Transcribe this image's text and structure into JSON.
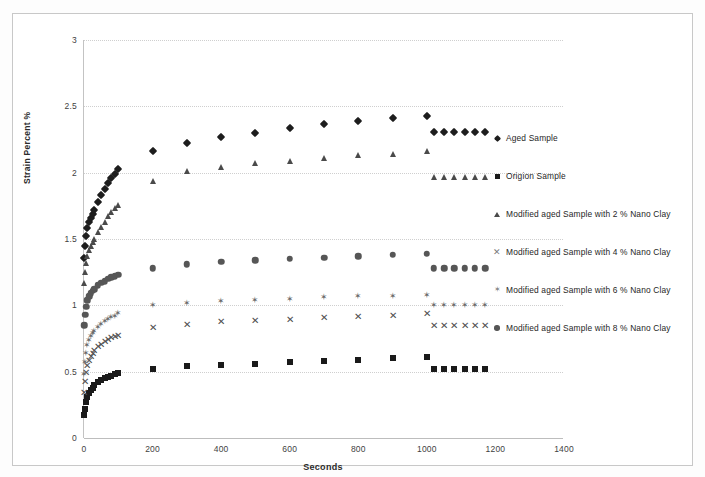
{
  "chart_data": {
    "type": "scatter",
    "title": "",
    "xlabel": "Seconds",
    "ylabel": "Strain Percent %",
    "xlim": [
      0,
      1400
    ],
    "ylim": [
      0,
      3
    ],
    "xticks": [
      0,
      200,
      400,
      600,
      800,
      1000,
      1200,
      1400
    ],
    "yticks": [
      0,
      0.5,
      1,
      1.5,
      2,
      2.5,
      3
    ],
    "grid": true,
    "legend_position": "right",
    "series": [
      {
        "name": "Aged Sample",
        "marker": "diamond",
        "color": "#1d1d1d",
        "x": [
          1,
          3,
          6,
          10,
          15,
          20,
          25,
          30,
          40,
          50,
          60,
          70,
          80,
          90,
          100,
          200,
          300,
          400,
          500,
          600,
          700,
          800,
          900,
          1000,
          1020,
          1050,
          1080,
          1110,
          1140,
          1170
        ],
        "y": [
          1.36,
          1.45,
          1.52,
          1.58,
          1.63,
          1.66,
          1.69,
          1.72,
          1.78,
          1.83,
          1.88,
          1.92,
          1.96,
          1.99,
          2.03,
          2.16,
          2.22,
          2.27,
          2.3,
          2.34,
          2.37,
          2.39,
          2.41,
          2.43,
          2.31,
          2.31,
          2.31,
          2.31,
          2.31,
          2.31
        ]
      },
      {
        "name": "Origion Sample",
        "marker": "square",
        "color": "#1a1a1a",
        "x": [
          1,
          3,
          6,
          10,
          15,
          20,
          25,
          30,
          40,
          50,
          60,
          70,
          80,
          90,
          100,
          200,
          300,
          400,
          500,
          600,
          700,
          800,
          900,
          1000,
          1020,
          1050,
          1080,
          1110,
          1140,
          1170
        ],
        "y": [
          0.17,
          0.22,
          0.27,
          0.31,
          0.34,
          0.36,
          0.38,
          0.4,
          0.42,
          0.44,
          0.45,
          0.46,
          0.47,
          0.48,
          0.49,
          0.52,
          0.54,
          0.55,
          0.56,
          0.57,
          0.58,
          0.59,
          0.6,
          0.61,
          0.52,
          0.52,
          0.52,
          0.52,
          0.52,
          0.52
        ]
      },
      {
        "name": "Modified aged Sample with 2 % Nano Clay",
        "marker": "triangle",
        "color": "#4a4a4a",
        "x": [
          1,
          3,
          6,
          10,
          15,
          20,
          25,
          30,
          40,
          50,
          60,
          70,
          80,
          90,
          100,
          200,
          300,
          400,
          500,
          600,
          700,
          800,
          900,
          1000,
          1020,
          1050,
          1080,
          1110,
          1140,
          1170
        ],
        "y": [
          1.17,
          1.25,
          1.32,
          1.37,
          1.42,
          1.45,
          1.48,
          1.5,
          1.55,
          1.59,
          1.63,
          1.67,
          1.7,
          1.73,
          1.76,
          1.94,
          2.01,
          2.04,
          2.07,
          2.09,
          2.11,
          2.13,
          2.14,
          2.16,
          1.97,
          1.97,
          1.97,
          1.97,
          1.97,
          1.97
        ]
      },
      {
        "name": "Modified aged Sample with 4 % Nano Clay",
        "marker": "cross",
        "color": "#4e4e4e",
        "x": [
          1,
          3,
          6,
          10,
          15,
          20,
          25,
          30,
          40,
          50,
          60,
          70,
          80,
          90,
          100,
          200,
          300,
          400,
          500,
          600,
          700,
          800,
          900,
          1000,
          1020,
          1050,
          1080,
          1110,
          1140,
          1170
        ],
        "y": [
          0.35,
          0.43,
          0.5,
          0.55,
          0.59,
          0.62,
          0.64,
          0.66,
          0.69,
          0.71,
          0.73,
          0.75,
          0.76,
          0.77,
          0.78,
          0.84,
          0.86,
          0.88,
          0.89,
          0.9,
          0.91,
          0.92,
          0.93,
          0.94,
          0.85,
          0.85,
          0.85,
          0.85,
          0.85,
          0.85
        ]
      },
      {
        "name": "Modified aged Sample with 6 % Nano Clay",
        "marker": "star",
        "color": "#6b6b6b",
        "x": [
          1,
          3,
          6,
          10,
          15,
          20,
          25,
          30,
          40,
          50,
          60,
          70,
          80,
          90,
          100,
          200,
          300,
          400,
          500,
          600,
          700,
          800,
          900,
          1000,
          1020,
          1050,
          1080,
          1110,
          1140,
          1170
        ],
        "y": [
          0.48,
          0.57,
          0.64,
          0.7,
          0.74,
          0.77,
          0.79,
          0.81,
          0.84,
          0.86,
          0.88,
          0.9,
          0.91,
          0.92,
          0.94,
          1.0,
          1.02,
          1.03,
          1.04,
          1.05,
          1.06,
          1.07,
          1.07,
          1.08,
          1.0,
          1.0,
          1.0,
          1.0,
          1.0,
          1.0
        ]
      },
      {
        "name": "Modified aged Sample with 8 % Nano Clay",
        "marker": "circle",
        "color": "#565656",
        "x": [
          1,
          3,
          6,
          10,
          15,
          20,
          25,
          30,
          40,
          50,
          60,
          70,
          80,
          90,
          100,
          200,
          300,
          400,
          500,
          600,
          700,
          800,
          900,
          1000,
          1020,
          1050,
          1080,
          1110,
          1140,
          1170
        ],
        "y": [
          0.85,
          0.93,
          0.99,
          1.04,
          1.07,
          1.09,
          1.11,
          1.12,
          1.15,
          1.17,
          1.18,
          1.2,
          1.21,
          1.22,
          1.23,
          1.28,
          1.31,
          1.33,
          1.34,
          1.35,
          1.36,
          1.37,
          1.38,
          1.39,
          1.28,
          1.28,
          1.28,
          1.28,
          1.28,
          1.28
        ]
      }
    ]
  },
  "axis": {
    "y_title": "Strain Percent %",
    "x_title": "Seconds",
    "y_tick_labels": [
      "0",
      "0.5",
      "1",
      "1.5",
      "2",
      "2.5",
      "3"
    ],
    "x_tick_labels": [
      "0",
      "200",
      "400",
      "600",
      "800",
      "1000",
      "1200",
      "1400"
    ]
  },
  "legend": {
    "items": [
      {
        "label": "Aged Sample",
        "marker": "diamond"
      },
      {
        "label": "Origion Sample",
        "marker": "square"
      },
      {
        "label": "Modified aged Sample with 2 % Nano Clay",
        "marker": "triangle"
      },
      {
        "label": "Modified aged Sample with 4 % Nano Clay",
        "marker": "cross"
      },
      {
        "label": "Modified aged Sample with 6 % Nano Clay",
        "marker": "star"
      },
      {
        "label": "Modified aged Sample with 8 % Nano Clay",
        "marker": "circle"
      }
    ]
  },
  "colors": {
    "grid": "#cfcfcf",
    "axis": "#bdbdbd",
    "frame": "#c8c8c8",
    "text": "#2b2b2b"
  }
}
